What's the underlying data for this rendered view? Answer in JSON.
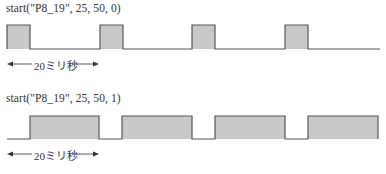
{
  "diagram": {
    "panels": [
      {
        "title": "start(\"P8_19\", 25, 50, 0)",
        "polarity": 0,
        "period_label": "20ミリ秒",
        "duty_percent": 25,
        "pulses_high": [
          [
            7,
            30
          ],
          [
            100,
            123
          ],
          [
            192,
            215
          ],
          [
            285,
            308
          ]
        ],
        "x_end": 380
      },
      {
        "title": "start(\"P8_19\", 25, 50, 1)",
        "polarity": 1,
        "period_label": "20ミリ秒",
        "duty_percent": 75,
        "pulses_high": [
          [
            30,
            99
          ],
          [
            122,
            192
          ],
          [
            215,
            285
          ],
          [
            308,
            378
          ]
        ],
        "x_end": 378
      }
    ],
    "colors": {
      "line": "#555555",
      "fill": "#c8c8c8",
      "text": "#333333"
    }
  }
}
